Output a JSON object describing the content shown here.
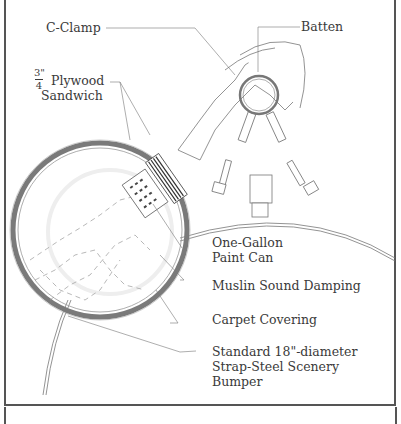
{
  "diagram": {
    "type": "technical-illustration",
    "labels": {
      "c_clamp": "C-Clamp",
      "batten": "Batten",
      "plywood_fraction_num": "3\"",
      "plywood_fraction_den": "4",
      "plywood_line1": "Plywood",
      "plywood_line2": "Sandwich",
      "paint_can_line1": "One-Gallon",
      "paint_can_line2": "Paint Can",
      "muslin": "Muslin Sound Damping",
      "carpet": "Carpet Covering",
      "bumper_line1": "Standard 18\"-diameter",
      "bumper_line2": "Strap-Steel Scenery",
      "bumper_line3": "Bumper"
    },
    "colors": {
      "line": "#6a6a6a",
      "text": "#3a3a3a",
      "can_rim": "#7a7a7a",
      "frame": "#555555"
    }
  }
}
